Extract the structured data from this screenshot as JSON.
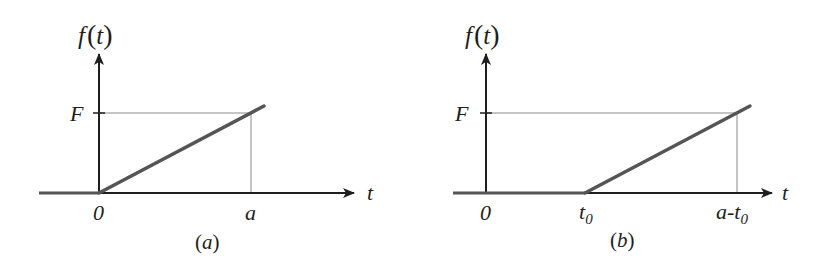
{
  "diagram": {
    "type": "ramp-function-plots",
    "colors": {
      "axis": "#1e1e1e",
      "ramp": "#555555",
      "guide": "#8a8a8a"
    },
    "panels": [
      {
        "id": "a",
        "caption": "(a)",
        "y_axis_label": "f(t)",
        "y_axis_label_parts": {
          "f": "f",
          "open": "(",
          "t": "t",
          "close": ")"
        },
        "x_axis_label": "t",
        "y_level_label": "F",
        "x_ticks": [
          {
            "label": "0",
            "sub": ""
          },
          {
            "label": "a",
            "sub": ""
          }
        ],
        "description": "Ramp starting at t=0 rising linearly, reaching F at t=a"
      },
      {
        "id": "b",
        "caption": "(b)",
        "y_axis_label": "f(t)",
        "y_axis_label_parts": {
          "f": "f",
          "open": "(",
          "t": "t",
          "close": ")"
        },
        "x_axis_label": "t",
        "y_level_label": "F",
        "x_ticks": [
          {
            "label": "0",
            "sub": ""
          },
          {
            "label": "t",
            "sub": "0"
          },
          {
            "label": "a-t",
            "sub": "0"
          }
        ],
        "description": "Ramp delayed to start at t=t0, reaching F at t=a-t0"
      }
    ]
  }
}
